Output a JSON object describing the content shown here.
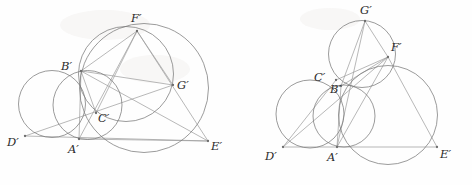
{
  "figure": {
    "width": 472,
    "height": 185,
    "background_color": "#fefefe",
    "circle_color": "#7a7a7a",
    "line_color": "#9a9a9a",
    "label_color": "#2b2b2b",
    "vertex_color": "#6d6d6d"
  },
  "diagrams": [
    {
      "id": "left-diagram",
      "name": "left-construction",
      "points": [
        {
          "id": "A",
          "label": "A′",
          "x": 79,
          "y": 139,
          "label_x": 68,
          "label_y": 153
        },
        {
          "id": "B",
          "label": "B′",
          "x": 81,
          "y": 71,
          "label_x": 61,
          "label_y": 70
        },
        {
          "id": "C",
          "label": "C′",
          "x": 96,
          "y": 113,
          "label_x": 98,
          "label_y": 122
        },
        {
          "id": "D",
          "label": "D′",
          "x": 25,
          "y": 136,
          "label_x": 7,
          "label_y": 146
        },
        {
          "id": "E",
          "label": "E′",
          "x": 208,
          "y": 141,
          "label_x": 211,
          "label_y": 150
        },
        {
          "id": "F",
          "label": "F′",
          "x": 137,
          "y": 31,
          "label_x": 131,
          "label_y": 22
        },
        {
          "id": "G",
          "label": "G′",
          "x": 173,
          "y": 85,
          "label_x": 177,
          "label_y": 89
        }
      ],
      "circles": [
        {
          "name": "circle-DAB",
          "cx": 52,
          "cy": 104,
          "r": 33.5
        },
        {
          "name": "circle-ABC",
          "cx": 87.5,
          "cy": 105,
          "r": 34.5
        },
        {
          "name": "circle-BFGC",
          "cx": 126,
          "cy": 74,
          "r": 47.5
        },
        {
          "name": "circle-AFE",
          "cx": 144,
          "cy": 88,
          "r": 64.5
        }
      ],
      "lines": [
        {
          "name": "line-D-E",
          "x1": 25,
          "y1": 136,
          "x2": 208,
          "y2": 141
        },
        {
          "name": "line-D-G",
          "x1": 25,
          "y1": 136,
          "x2": 173,
          "y2": 85
        },
        {
          "name": "line-B-F",
          "x1": 81,
          "y1": 71,
          "x2": 137,
          "y2": 31
        },
        {
          "name": "line-B-G",
          "x1": 81,
          "y1": 71,
          "x2": 173,
          "y2": 85
        },
        {
          "name": "line-B-E",
          "x1": 81,
          "y1": 71,
          "x2": 208,
          "y2": 141
        },
        {
          "name": "line-B-A",
          "x1": 81,
          "y1": 71,
          "x2": 79,
          "y2": 139
        },
        {
          "name": "line-B-C",
          "x1": 81,
          "y1": 71,
          "x2": 96,
          "y2": 113
        },
        {
          "name": "line-A-F",
          "x1": 79,
          "y1": 139,
          "x2": 137,
          "y2": 31
        },
        {
          "name": "line-C-F",
          "x1": 96,
          "y1": 113,
          "x2": 137,
          "y2": 31
        },
        {
          "name": "line-F-E",
          "x1": 137,
          "y1": 31,
          "x2": 208,
          "y2": 141
        },
        {
          "name": "line-F-G",
          "x1": 137,
          "y1": 31,
          "x2": 173,
          "y2": 85
        },
        {
          "name": "line-A-E",
          "x1": 79,
          "y1": 139,
          "x2": 208,
          "y2": 141
        }
      ]
    },
    {
      "id": "right-diagram",
      "name": "right-construction",
      "points": [
        {
          "id": "A",
          "label": "A′",
          "x": 337,
          "y": 147,
          "label_x": 327,
          "label_y": 161
        },
        {
          "id": "B",
          "label": "B′",
          "x": 341,
          "y": 86,
          "label_x": 330,
          "label_y": 93
        },
        {
          "id": "C",
          "label": "C′",
          "x": 336,
          "y": 80,
          "label_x": 314,
          "label_y": 81
        },
        {
          "id": "D",
          "label": "D′",
          "x": 283,
          "y": 147,
          "label_x": 265,
          "label_y": 160
        },
        {
          "id": "E",
          "label": "E′",
          "x": 437,
          "y": 147,
          "label_x": 440,
          "label_y": 158
        },
        {
          "id": "F",
          "label": "F′",
          "x": 388,
          "y": 57,
          "label_x": 391,
          "label_y": 51
        },
        {
          "id": "G",
          "label": "G′",
          "x": 365,
          "y": 21,
          "label_x": 360,
          "label_y": 14
        }
      ],
      "circles": [
        {
          "name": "circle-DACB",
          "cx": 310,
          "cy": 114,
          "r": 34.0
        },
        {
          "name": "circle-ABF",
          "cx": 344,
          "cy": 116,
          "r": 31.0
        },
        {
          "name": "circle-GCF",
          "cx": 362,
          "cy": 54,
          "r": 33.5
        },
        {
          "name": "circle-AFE",
          "cx": 388,
          "cy": 115,
          "r": 49.5
        }
      ],
      "lines": [
        {
          "name": "line-D-E",
          "x1": 283,
          "y1": 147,
          "x2": 437,
          "y2": 147
        },
        {
          "name": "line-D-F",
          "x1": 283,
          "y1": 147,
          "x2": 388,
          "y2": 57
        },
        {
          "name": "line-D-C",
          "x1": 283,
          "y1": 147,
          "x2": 336,
          "y2": 80
        },
        {
          "name": "line-A-G",
          "x1": 337,
          "y1": 147,
          "x2": 365,
          "y2": 21
        },
        {
          "name": "line-A-B",
          "x1": 337,
          "y1": 147,
          "x2": 341,
          "y2": 86
        },
        {
          "name": "line-A-F",
          "x1": 337,
          "y1": 147,
          "x2": 388,
          "y2": 57
        },
        {
          "name": "line-G-F",
          "x1": 365,
          "y1": 21,
          "x2": 388,
          "y2": 57
        },
        {
          "name": "line-G-B",
          "x1": 365,
          "y1": 21,
          "x2": 341,
          "y2": 86
        },
        {
          "name": "line-B-F",
          "x1": 341,
          "y1": 86,
          "x2": 388,
          "y2": 57
        },
        {
          "name": "line-C-F",
          "x1": 336,
          "y1": 80,
          "x2": 388,
          "y2": 57
        },
        {
          "name": "line-F-E",
          "x1": 388,
          "y1": 57,
          "x2": 437,
          "y2": 147
        }
      ]
    }
  ],
  "chart_data": {
    "type": "diagram",
    "point_labels": [
      "A′",
      "B′",
      "C′",
      "D′",
      "E′",
      "F′",
      "G′"
    ],
    "panels": 2,
    "circles_per_panel": 4
  }
}
